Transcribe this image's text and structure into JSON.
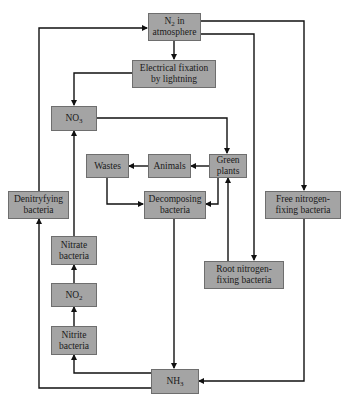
{
  "diagram": {
    "colors": {
      "box_fill": "#a4a4a4",
      "box_border": "#6e6e6e",
      "line": "#111111",
      "background": "#ffffff"
    },
    "nodes": {
      "n2": {
        "label_main": "N",
        "label_sub": "2",
        "label_rest": " in\natmosphere"
      },
      "lightning": {
        "label": "Electrical fixation\nby lightning"
      },
      "no3": {
        "label_main": "NO",
        "label_sub": "3"
      },
      "wastes": {
        "label": "Wastes"
      },
      "animals": {
        "label": "Animals"
      },
      "green_plants": {
        "label": "Green\nplants"
      },
      "decomposing": {
        "label": "Decomposing\nbacteria"
      },
      "denitrifying": {
        "label": "Denitryfying\nbacteria"
      },
      "free_fixing": {
        "label": "Free nitrogen-\nfixing bacteria"
      },
      "nitrate": {
        "label": "Nitrate\nbacteria"
      },
      "no2": {
        "label_main": "NO",
        "label_sub": "2"
      },
      "nitrite": {
        "label": "Nitrite\nbacteria"
      },
      "root_fixing": {
        "label": "Root nitrogen-\nfixing bacteria"
      },
      "nh3": {
        "label_main": "NH",
        "label_sub": "3"
      }
    },
    "edges": [
      {
        "from": "N2 in atmosphere",
        "to": "Electrical fixation by lightning"
      },
      {
        "from": "N2 in atmosphere",
        "to": "Free nitrogen-fixing bacteria"
      },
      {
        "from": "N2 in atmosphere",
        "to": "Root nitrogen-fixing bacteria"
      },
      {
        "from": "Electrical fixation by lightning",
        "to": "NO3"
      },
      {
        "from": "NO3",
        "to": "Green plants"
      },
      {
        "from": "Green plants",
        "to": "Animals"
      },
      {
        "from": "Animals",
        "to": "Wastes"
      },
      {
        "from": "Wastes",
        "to": "Decomposing bacteria"
      },
      {
        "from": "Green plants",
        "to": "Decomposing bacteria"
      },
      {
        "from": "Root nitrogen-fixing bacteria",
        "to": "Green plants"
      },
      {
        "from": "Decomposing bacteria",
        "to": "NH3"
      },
      {
        "from": "Free nitrogen-fixing bacteria",
        "to": "NH3"
      },
      {
        "from": "NH3",
        "to": "Nitrite bacteria"
      },
      {
        "from": "Nitrite bacteria",
        "to": "NO2"
      },
      {
        "from": "NO2",
        "to": "Nitrate bacteria"
      },
      {
        "from": "Nitrate bacteria",
        "to": "NO3"
      },
      {
        "from": "NH3",
        "to": "Denitryfying bacteria"
      },
      {
        "from": "Denitryfying bacteria",
        "to": "N2 in atmosphere"
      }
    ]
  }
}
